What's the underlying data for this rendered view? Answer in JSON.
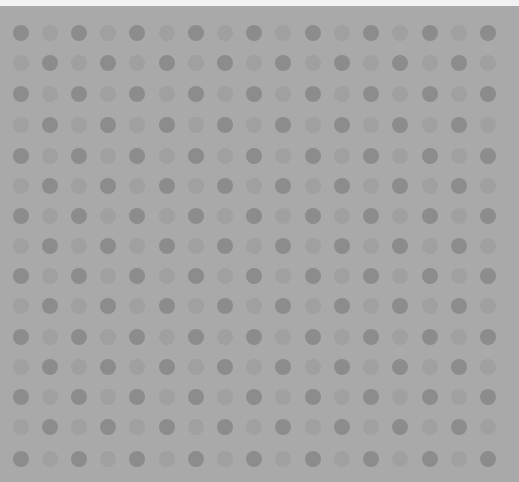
{
  "pattern": {
    "type": "polka-dot-checkerboard",
    "rows": 15,
    "cols": 17,
    "col_centers": [
      21,
      50,
      79,
      108,
      137,
      167,
      196,
      225,
      254,
      283,
      313,
      342,
      371,
      400,
      430,
      459,
      488
    ],
    "row_centers": [
      33,
      63,
      94,
      125,
      156,
      186,
      216,
      246,
      276,
      306,
      337,
      367,
      397,
      427,
      459
    ],
    "dot_diameter": 16,
    "colors": {
      "background": "#a9a9a9",
      "dark_dot": "#8c8c8c",
      "light_dot": "#a0a0a0",
      "top_strip": "#f2f2f2"
    }
  }
}
